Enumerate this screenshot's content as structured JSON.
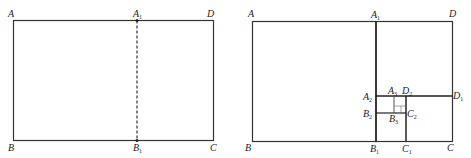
{
  "figure_left": {
    "labels": {
      "A": "A",
      "D": "D",
      "B": "B",
      "C": "C",
      "A1": "A",
      "A1_sub": "1",
      "B1": "B",
      "B1_sub": "1"
    }
  },
  "figure_right": {
    "labels": {
      "A": "A",
      "D": "D",
      "B": "B",
      "C": "C",
      "A1": "A",
      "A1_sub": "1",
      "B1": "B",
      "B1_sub": "1",
      "A2": "A",
      "A2_sub": "2",
      "B2": "B",
      "B2_sub": "2",
      "C1": "C",
      "C1_sub": "1",
      "C2": "C",
      "C2_sub": "2",
      "D1": "D",
      "D1_sub": "1",
      "D2": "D",
      "D2_sub": "2",
      "A3": "A",
      "A3_sub": "3",
      "B3": "B",
      "B3_sub": "3"
    }
  }
}
